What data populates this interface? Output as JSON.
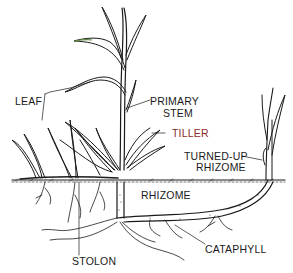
{
  "diagram": {
    "labels": {
      "leaf": "LEAF",
      "primary_stem_line1": "PRIMARY",
      "primary_stem_line2": "STEM",
      "tiller": "TILLER",
      "turned_up_rhizome_line1": "TURNED-UP",
      "turned_up_rhizome_line2": "RHIZOME",
      "rhizome": "RHIZOME",
      "stolon": "STOLON",
      "cataphyll": "CATAPHYLL"
    },
    "colors": {
      "line": "#1a1a1a",
      "tiller_label": "#8b2a2a",
      "leaf_tip_tint": "#5a8a3a",
      "background": "#ffffff"
    }
  }
}
